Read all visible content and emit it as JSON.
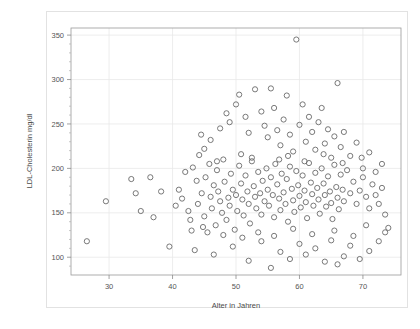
{
  "chart_data": {
    "type": "scatter",
    "title": "",
    "xlabel": "Alter in Jahren",
    "ylabel": "LDL-Cholesterin mg/dl",
    "xlim": [
      24,
      76
    ],
    "ylim": [
      80,
      358
    ],
    "xticks": [
      30,
      40,
      50,
      60,
      70
    ],
    "yticks": [
      100,
      150,
      200,
      250,
      300,
      350
    ],
    "xtick_labels": [
      "30",
      "40",
      "50",
      "60",
      "70"
    ],
    "ytick_labels": [
      "100",
      "150",
      "200",
      "250",
      "300",
      "350"
    ],
    "grid": true,
    "grid_color": "#e8e8e8",
    "marker": "open-circle",
    "marker_color": "#6a6a6a",
    "marker_size": 3.4,
    "legend": "none",
    "series": [
      {
        "name": "Patienten",
        "points": [
          [
            26.5,
            118
          ],
          [
            29.5,
            163
          ],
          [
            33.5,
            188
          ],
          [
            34.2,
            172
          ],
          [
            37.0,
            145
          ],
          [
            39.5,
            112
          ],
          [
            41.0,
            176
          ],
          [
            41.5,
            166
          ],
          [
            42.0,
            196
          ],
          [
            42.5,
            152
          ],
          [
            43.0,
            130
          ],
          [
            43.2,
            201
          ],
          [
            43.8,
            186
          ],
          [
            44.0,
            160
          ],
          [
            44.2,
            215
          ],
          [
            44.6,
            172
          ],
          [
            45.0,
            146
          ],
          [
            45.2,
            190
          ],
          [
            45.5,
            128
          ],
          [
            45.8,
            205
          ],
          [
            46.0,
            168
          ],
          [
            46.2,
            155
          ],
          [
            46.5,
            181
          ],
          [
            46.8,
            136
          ],
          [
            47.0,
            198
          ],
          [
            47.2,
            174
          ],
          [
            47.5,
            163
          ],
          [
            47.8,
            150
          ],
          [
            48.0,
            210
          ],
          [
            48.2,
            185
          ],
          [
            48.5,
            142
          ],
          [
            48.8,
            167
          ],
          [
            49.0,
            158
          ],
          [
            49.2,
            194
          ],
          [
            49.5,
            176
          ],
          [
            49.8,
            131
          ],
          [
            50.0,
            170
          ],
          [
            50.2,
            152
          ],
          [
            50.5,
            203
          ],
          [
            50.8,
            183
          ],
          [
            51.0,
            165
          ],
          [
            51.2,
            147
          ],
          [
            51.5,
            192
          ],
          [
            51.8,
            174
          ],
          [
            52.0,
            160
          ],
          [
            52.2,
            138
          ],
          [
            52.5,
            208
          ],
          [
            52.8,
            180
          ],
          [
            53.0,
            168
          ],
          [
            53.2,
            155
          ],
          [
            53.5,
            196
          ],
          [
            53.8,
            172
          ],
          [
            54.0,
            148
          ],
          [
            54.2,
            186
          ],
          [
            54.5,
            163
          ],
          [
            54.8,
            200
          ],
          [
            55.0,
            176
          ],
          [
            55.2,
            158
          ],
          [
            55.5,
            190
          ],
          [
            55.8,
            170
          ],
          [
            56.0,
            145
          ],
          [
            56.2,
            205
          ],
          [
            56.5,
            182
          ],
          [
            56.8,
            166
          ],
          [
            57.0,
            153
          ],
          [
            57.2,
            194
          ],
          [
            57.5,
            173
          ],
          [
            57.8,
            160
          ],
          [
            58.0,
            188
          ],
          [
            58.2,
            140
          ],
          [
            58.5,
            202
          ],
          [
            58.8,
            177
          ],
          [
            59.0,
            164
          ],
          [
            59.2,
            151
          ],
          [
            59.5,
            197
          ],
          [
            59.8,
            181
          ],
          [
            60.0,
            169
          ],
          [
            60.2,
            156
          ],
          [
            60.5,
            192
          ],
          [
            60.8,
            175
          ],
          [
            61.0,
            162
          ],
          [
            61.2,
            144
          ],
          [
            61.5,
            206
          ],
          [
            61.8,
            184
          ],
          [
            62.0,
            171
          ],
          [
            62.2,
            158
          ],
          [
            62.5,
            195
          ],
          [
            62.8,
            178
          ],
          [
            63.0,
            165
          ],
          [
            63.2,
            149
          ],
          [
            63.5,
            200
          ],
          [
            63.8,
            183
          ],
          [
            64.0,
            170
          ],
          [
            64.2,
            157
          ],
          [
            64.5,
            191
          ],
          [
            64.8,
            174
          ],
          [
            65.0,
            161
          ],
          [
            65.2,
            143
          ],
          [
            65.5,
            204
          ],
          [
            65.8,
            179
          ],
          [
            66.0,
            167
          ],
          [
            66.2,
            154
          ],
          [
            66.5,
            193
          ],
          [
            66.8,
            176
          ],
          [
            67.0,
            163
          ],
          [
            67.5,
            198
          ],
          [
            68.0,
            172
          ],
          [
            68.5,
            185
          ],
          [
            69.0,
            160
          ],
          [
            69.5,
            175
          ],
          [
            70.0,
            190
          ],
          [
            70.5,
            168
          ],
          [
            71.0,
            155
          ],
          [
            71.5,
            182
          ],
          [
            72.0,
            170
          ],
          [
            72.5,
            160
          ],
          [
            73.0,
            178
          ],
          [
            73.5,
            148
          ],
          [
            74.0,
            133
          ],
          [
            44.5,
            238
          ],
          [
            46.0,
            232
          ],
          [
            47.5,
            245
          ],
          [
            48.5,
            262
          ],
          [
            49.0,
            252
          ],
          [
            50.0,
            272
          ],
          [
            50.5,
            283
          ],
          [
            51.5,
            258
          ],
          [
            52.0,
            240
          ],
          [
            53.0,
            289
          ],
          [
            54.0,
            264
          ],
          [
            54.5,
            248
          ],
          [
            55.0,
            235
          ],
          [
            55.5,
            290
          ],
          [
            56.0,
            268
          ],
          [
            56.5,
            243
          ],
          [
            57.0,
            226
          ],
          [
            57.5,
            255
          ],
          [
            58.0,
            282
          ],
          [
            58.5,
            238
          ],
          [
            59.0,
            219
          ],
          [
            59.5,
            345
          ],
          [
            60.0,
            249
          ],
          [
            60.5,
            272
          ],
          [
            61.0,
            230
          ],
          [
            61.5,
            258
          ],
          [
            62.0,
            241
          ],
          [
            62.5,
            221
          ],
          [
            63.0,
            252
          ],
          [
            63.5,
            268
          ],
          [
            64.0,
            228
          ],
          [
            64.5,
            244
          ],
          [
            65.0,
            212
          ],
          [
            65.5,
            236
          ],
          [
            66.0,
            296
          ],
          [
            66.5,
            224
          ],
          [
            67.0,
            241
          ],
          [
            68.0,
            214
          ],
          [
            69.0,
            229
          ],
          [
            70.0,
            200
          ],
          [
            71.0,
            218
          ],
          [
            72.0,
            196
          ],
          [
            73.0,
            205
          ],
          [
            43.5,
            108
          ],
          [
            46.5,
            103
          ],
          [
            49.5,
            112
          ],
          [
            52.0,
            96
          ],
          [
            54.0,
            118
          ],
          [
            55.5,
            88
          ],
          [
            57.0,
            106
          ],
          [
            58.5,
            98
          ],
          [
            60.0,
            115
          ],
          [
            61.0,
            103
          ],
          [
            62.5,
            110
          ],
          [
            64.0,
            95
          ],
          [
            65.0,
            119
          ],
          [
            66.0,
            92
          ],
          [
            67.0,
            101
          ],
          [
            68.0,
            113
          ],
          [
            69.5,
            98
          ],
          [
            71.0,
            107
          ],
          [
            72.5,
            118
          ],
          [
            48.0,
            125
          ],
          [
            51.0,
            122
          ],
          [
            53.5,
            128
          ],
          [
            56.0,
            124
          ],
          [
            59.0,
            132
          ],
          [
            62.0,
            126
          ],
          [
            65.5,
            130
          ],
          [
            68.5,
            124
          ],
          [
            70.5,
            136
          ],
          [
            73.5,
            128
          ],
          [
            45.0,
            222
          ],
          [
            47.0,
            208
          ],
          [
            50.8,
            216
          ],
          [
            52.5,
            212
          ],
          [
            56.8,
            210
          ],
          [
            58.2,
            214
          ],
          [
            60.8,
            208
          ],
          [
            63.8,
            216
          ],
          [
            66.8,
            206
          ],
          [
            69.8,
            212
          ],
          [
            40.5,
            158
          ],
          [
            42.8,
            142
          ],
          [
            44.8,
            134
          ],
          [
            38.2,
            174
          ],
          [
            36.5,
            190
          ],
          [
            35.0,
            152
          ]
        ]
      }
    ]
  },
  "axes": {
    "x_title": "Alter in Jahren",
    "y_title": "LDL-Cholesterin mg/dl"
  }
}
